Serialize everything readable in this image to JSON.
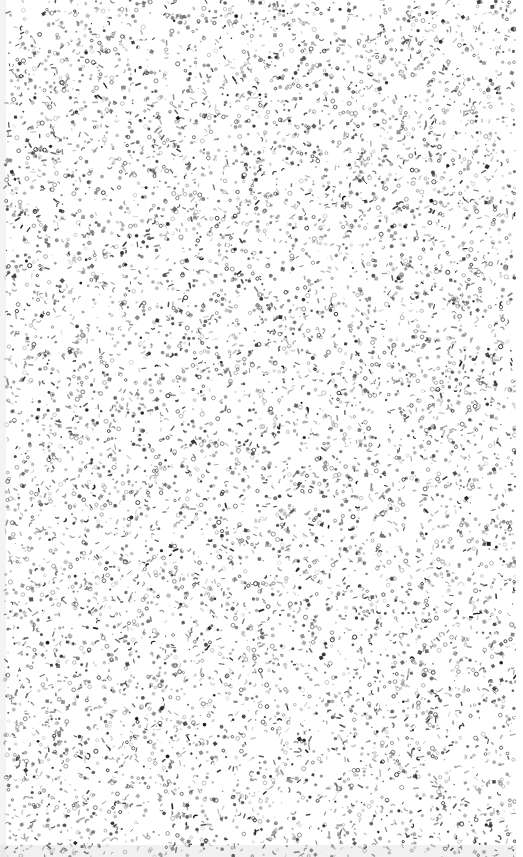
{
  "canvas": {
    "width": 523,
    "height": 857,
    "background_color": "#ffffff",
    "description": "Full-bleed random speckle texture"
  },
  "texture": {
    "name": "dense-speckle-field",
    "kind": "stipple-noise",
    "mark_count": 9000,
    "margins": {
      "left": 5,
      "right": 7,
      "top": 0,
      "bottom": 0
    },
    "seed": 20240517,
    "mark_colors": [
      "#1a1a1a",
      "#333333",
      "#4d4d4d",
      "#6b6b6b",
      "#8e8e8e",
      "#aaaaaa"
    ],
    "mark_shapes": [
      "filled-dot",
      "open-ring",
      "short-dash",
      "comma-tick",
      "filled-square"
    ],
    "shape_weights": [
      0.34,
      0.18,
      0.2,
      0.16,
      0.12
    ],
    "size_range_px": [
      1,
      4
    ],
    "ring_size_range_px": [
      2.2,
      4.2
    ],
    "dash_length_range_px": [
      2,
      5
    ],
    "opacity_range": [
      0.35,
      1.0
    ]
  },
  "accents": {
    "bottom_smudge": {
      "name": "bottom-gray-band",
      "top": 845,
      "height": 12,
      "color": "#bfbfbf",
      "opacity": 0.22
    },
    "left_edge_wash": {
      "name": "left-edge-wash",
      "left": 0,
      "width": 6,
      "color": "#d9d9d9",
      "opacity": 0.3
    },
    "right_edge_wash": {
      "name": "right-edge-wash",
      "left": 516,
      "width": 7,
      "color": "#ffffff",
      "opacity": 1.0
    }
  }
}
